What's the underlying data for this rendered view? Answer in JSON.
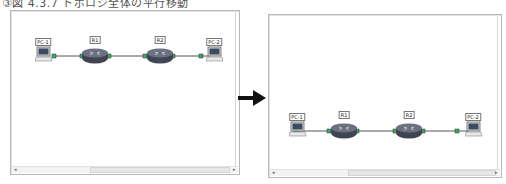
{
  "caption": "③図 4.3.7 トポロジ全体の平行移動",
  "arrow": {
    "direction": "right",
    "color": "#111111"
  },
  "panels": [
    {
      "name": "before",
      "nodes": [
        {
          "id": "pc1",
          "label": "PC-1",
          "type": "pc",
          "screen_text": "VPCS"
        },
        {
          "id": "r1",
          "label": "R1",
          "type": "router"
        },
        {
          "id": "r2",
          "label": "R2",
          "type": "router"
        },
        {
          "id": "pc2",
          "label": "PC-2",
          "type": "pc",
          "screen_text": "VPCS"
        }
      ],
      "links": [
        [
          "pc1",
          "r1"
        ],
        [
          "r1",
          "r2"
        ],
        [
          "r2",
          "pc2"
        ]
      ]
    },
    {
      "name": "after",
      "nodes": [
        {
          "id": "pc1",
          "label": "PC-1",
          "type": "pc",
          "screen_text": "VPCS"
        },
        {
          "id": "r1",
          "label": "R1",
          "type": "router"
        },
        {
          "id": "r2",
          "label": "R2",
          "type": "router"
        },
        {
          "id": "pc2",
          "label": "PC-2",
          "type": "pc",
          "screen_text": "VPCS"
        }
      ],
      "links": [
        [
          "pc1",
          "r1"
        ],
        [
          "r1",
          "r2"
        ],
        [
          "r2",
          "pc2"
        ]
      ]
    }
  ],
  "colors": {
    "router": "#4a4f5c",
    "link": "#555555",
    "panel_border": "#b8b8b8"
  }
}
